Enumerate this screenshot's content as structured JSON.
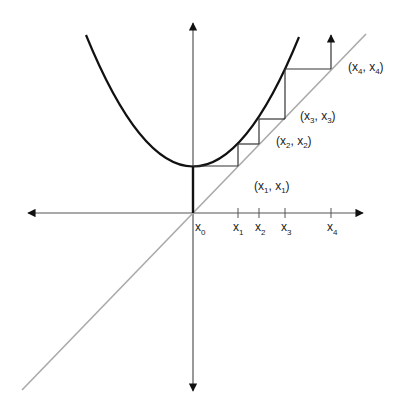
{
  "diagram": {
    "type": "fixed-point-iteration-cobweb",
    "colors": {
      "axes": "#555555",
      "parabola": "#111111",
      "diagonal": "#aaaaaa",
      "staircase": "#333333",
      "labels": "#222222"
    },
    "axis_labels": [
      {
        "id": "x0",
        "base": "x",
        "sub": "0"
      },
      {
        "id": "x1",
        "base": "x",
        "sub": "1"
      },
      {
        "id": "x2",
        "base": "x",
        "sub": "2"
      },
      {
        "id": "x3",
        "base": "x",
        "sub": "3"
      },
      {
        "id": "x4",
        "base": "x",
        "sub": "4"
      }
    ],
    "point_labels": [
      {
        "id": "p1",
        "open": "(",
        "a": "x",
        "asub": "1",
        "sep": ", ",
        "b": "x",
        "bsub": "1",
        "close": ")"
      },
      {
        "id": "p2",
        "open": "(",
        "a": "x",
        "asub": "2",
        "sep": ", ",
        "b": "x",
        "bsub": "2",
        "close": ")"
      },
      {
        "id": "p3",
        "open": "(",
        "a": "x",
        "asub": "3",
        "sep": ", ",
        "b": "x",
        "bsub": "3",
        "close": ")"
      },
      {
        "id": "p4",
        "open": "(",
        "a": "x",
        "asub": "4",
        "sep": ", ",
        "b": "x",
        "bsub": "4",
        "close": ")"
      }
    ]
  }
}
